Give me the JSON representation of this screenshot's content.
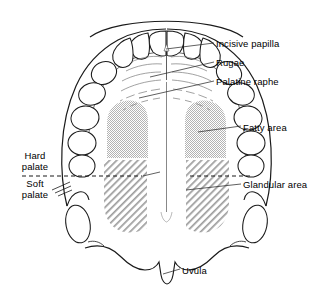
{
  "figure": {
    "background_color": "#ffffff",
    "line_color": "#1a1a1a",
    "text_color": "#000000"
  },
  "labels": {
    "incisive_papilla": "Incisive papilla",
    "rugae": "Rugae",
    "palatine_raphe": "Palatine raphe",
    "fatty_area": "Fatty area",
    "glandular_area": "Glandular area",
    "uvula": "Uvula",
    "hard_palate": "Hard palate",
    "soft_palate": "Soft palate"
  },
  "regions": {
    "fatty_area": {
      "fill_style": "dotted-checker",
      "fill_color": "#b9b9b9",
      "side": "paired-left-right"
    },
    "glandular_area": {
      "fill_style": "diagonal-hatch",
      "fill_color": "#9a9a9a",
      "side": "paired-left-right"
    },
    "palate_divider": {
      "style": "dashed",
      "orientation": "horizontal"
    }
  },
  "teeth": {
    "description": "Maxillary dental arch, upper teeth viewed from below",
    "count_visible": 16
  }
}
